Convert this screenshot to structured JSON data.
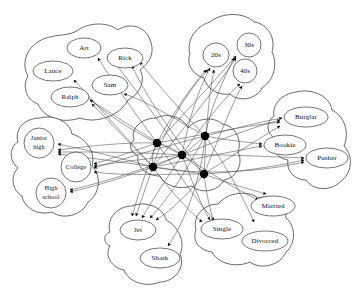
{
  "figure": {
    "type": "node-link-diagram",
    "background_color": "#ffffff",
    "line_color": "#4a4a4a",
    "instance_node_color": "#000000",
    "concept_node_fill": "#ffffff",
    "cluster_outline_color": "#2a2a2a",
    "instance_node_count": 5,
    "instance_nodes_label": ""
  },
  "clusters": [
    {
      "id": "names",
      "name": "names-cluster",
      "nodes": [
        {
          "id": "art",
          "label": "Art",
          "cx": 84,
          "cy": 48,
          "rx": 17,
          "ry": 10
        },
        {
          "id": "rick",
          "label": "Rick",
          "cx": 125,
          "cy": 58,
          "rx": 18,
          "ry": 10
        },
        {
          "id": "lance",
          "label": "Lance",
          "cx": 53,
          "cy": 71,
          "rx": 20,
          "ry": 10
        },
        {
          "id": "sam",
          "label": "Sam",
          "cx": 110,
          "cy": 85,
          "rx": 18,
          "ry": 10
        },
        {
          "id": "ralph",
          "label": "Ralph",
          "cx": 70,
          "cy": 97,
          "rx": 19,
          "ry": 10
        }
      ]
    },
    {
      "id": "ages",
      "name": "ages-cluster",
      "nodes": [
        {
          "id": "20s",
          "label": "20s",
          "cx": 216,
          "cy": 55,
          "rx": 13,
          "ry": 12
        },
        {
          "id": "30s",
          "label": "30s",
          "cx": 249,
          "cy": 45,
          "rx": 12,
          "ry": 12
        },
        {
          "id": "40s",
          "label": "40s",
          "cx": 245,
          "cy": 71,
          "rx": 12,
          "ry": 12
        }
      ]
    },
    {
      "id": "occupations",
      "name": "occupations-cluster",
      "nodes": [
        {
          "id": "burglar",
          "label": "Burglar",
          "cx": 306,
          "cy": 117,
          "rx": 22,
          "ry": 10
        },
        {
          "id": "bookie",
          "label": "Bookie",
          "cx": 285,
          "cy": 145,
          "rx": 21,
          "ry": 10
        },
        {
          "id": "pusher",
          "label": "Pusher",
          "cx": 327,
          "cy": 158,
          "rx": 21,
          "ry": 10
        }
      ]
    },
    {
      "id": "marital",
      "name": "marital-status-cluster",
      "nodes": [
        {
          "id": "married",
          "label": "Married",
          "cx": 273,
          "cy": 206,
          "rx": 22,
          "ry": 10
        },
        {
          "id": "single",
          "label": "Single",
          "cx": 222,
          "cy": 229,
          "rx": 21,
          "ry": 10
        },
        {
          "id": "divorced",
          "label": "Divorced",
          "cx": 265,
          "cy": 241,
          "rx": 23,
          "ry": 10
        }
      ]
    },
    {
      "id": "gangs",
      "name": "gangs-cluster",
      "nodes": [
        {
          "id": "jet",
          "label": "Jet",
          "cx": 138,
          "cy": 230,
          "rx": 18,
          "ry": 10
        },
        {
          "id": "shark",
          "label": "Shark",
          "cx": 160,
          "cy": 258,
          "rx": 20,
          "ry": 10
        }
      ]
    },
    {
      "id": "education",
      "name": "education-cluster",
      "nodes": [
        {
          "id": "juniorhigh",
          "label": "Junior high",
          "cx": 39,
          "cy": 143,
          "rx": 15,
          "ry": 15
        },
        {
          "id": "college",
          "label": "College",
          "cx": 76,
          "cy": 167,
          "rx": 15,
          "ry": 15
        },
        {
          "id": "highschool",
          "label": "High school",
          "cx": 51,
          "cy": 193,
          "rx": 15,
          "ry": 15
        }
      ]
    }
  ],
  "instances": [
    {
      "id": "i1",
      "cx": 157,
      "cy": 143
    },
    {
      "id": "i2",
      "cx": 182,
      "cy": 155
    },
    {
      "id": "i3",
      "cx": 153,
      "cy": 167
    },
    {
      "id": "i4",
      "cx": 205,
      "cy": 136
    },
    {
      "id": "i5",
      "cx": 204,
      "cy": 174
    }
  ]
}
